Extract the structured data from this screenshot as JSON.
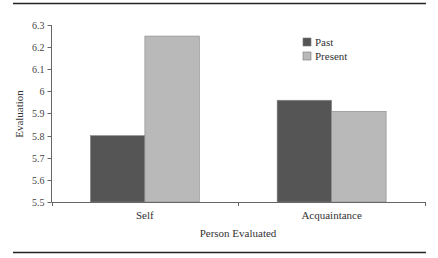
{
  "chart_data": {
    "type": "bar",
    "title": "",
    "xlabel": "Person Evaluated",
    "ylabel": "Evaluation",
    "categories": [
      "Self",
      "Acquaintance"
    ],
    "series": [
      {
        "name": "Past",
        "values": [
          5.8,
          5.96
        ],
        "color": "#555555"
      },
      {
        "name": "Present",
        "values": [
          6.25,
          5.91
        ],
        "color": "#b9b9b9"
      }
    ],
    "ylim": [
      5.5,
      6.3
    ],
    "yticks": [
      "5.5",
      "5.6",
      "5.7",
      "5.8",
      "5.9",
      "6",
      "6.1",
      "6.2",
      "6.3"
    ],
    "grid": false,
    "legend_position": "upper-right-inside"
  }
}
